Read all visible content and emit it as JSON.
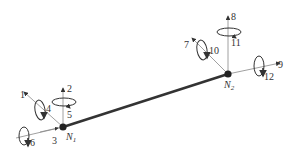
{
  "diagram": {
    "title": "",
    "element": {
      "type": "beam",
      "color": "#333333"
    },
    "nodes": [
      {
        "id": "N1",
        "label": "N",
        "subscript": "1",
        "x": 63,
        "y": 127
      },
      {
        "id": "N2",
        "label": "N",
        "subscript": "2",
        "x": 228,
        "y": 74
      }
    ],
    "dofs": [
      {
        "n": "1",
        "kind": "translation",
        "axis": "x",
        "node": "N1"
      },
      {
        "n": "2",
        "kind": "translation",
        "axis": "y",
        "node": "N1"
      },
      {
        "n": "3",
        "kind": "translation",
        "axis": "z",
        "node": "N1"
      },
      {
        "n": "4",
        "kind": "rotation",
        "axis": "x",
        "node": "N1"
      },
      {
        "n": "5",
        "kind": "rotation",
        "axis": "y",
        "node": "N1"
      },
      {
        "n": "6",
        "kind": "rotation",
        "axis": "z",
        "node": "N1"
      },
      {
        "n": "7",
        "kind": "translation",
        "axis": "x",
        "node": "N2"
      },
      {
        "n": "8",
        "kind": "translation",
        "axis": "y",
        "node": "N2"
      },
      {
        "n": "9",
        "kind": "translation",
        "axis": "z",
        "node": "N2"
      },
      {
        "n": "10",
        "kind": "rotation",
        "axis": "x",
        "node": "N2"
      },
      {
        "n": "11",
        "kind": "rotation",
        "axis": "y",
        "node": "N2"
      },
      {
        "n": "12",
        "kind": "rotation",
        "axis": "z",
        "node": "N2"
      }
    ]
  }
}
